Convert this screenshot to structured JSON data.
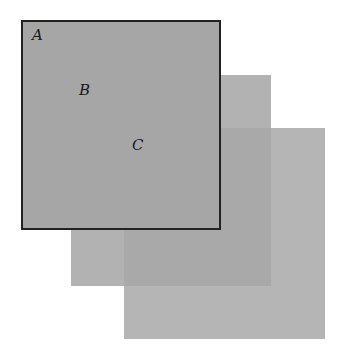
{
  "diagram": {
    "squares": [
      {
        "id": "C",
        "label": "C",
        "left": 124,
        "top": 128,
        "width": 201,
        "height": 211,
        "color": "#b5b5b5",
        "border": "none"
      },
      {
        "id": "B",
        "label": "B",
        "left": 71,
        "top": 75,
        "width": 200,
        "height": 211,
        "color": "#b2b2b2",
        "border": "none"
      },
      {
        "id": "A",
        "label": "A",
        "left": 21,
        "top": 20,
        "width": 200,
        "height": 210,
        "color": "#a6a6a6",
        "border": "#222222"
      }
    ],
    "overlap_BC_color": "#a9a9a9",
    "labels": [
      {
        "text": "A",
        "x": 32,
        "y": 28
      },
      {
        "text": "B",
        "x": 79,
        "y": 83
      },
      {
        "text": "C",
        "x": 132,
        "y": 138
      }
    ]
  }
}
